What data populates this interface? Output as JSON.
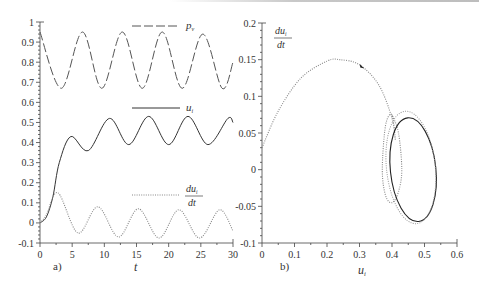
{
  "chart_data": [
    {
      "panel": "a)",
      "type": "line",
      "xlabel": "t",
      "ylabel": "",
      "xlim": [
        0,
        30
      ],
      "ylim": [
        -0.1,
        1
      ],
      "xticks": [
        0,
        5,
        10,
        15,
        20,
        25,
        30
      ],
      "xtick_labels": [
        "0",
        "5",
        "10",
        "15",
        "20",
        "25",
        "30"
      ],
      "yticks": [
        -0.1,
        0,
        0.1,
        0.2,
        0.3,
        0.4,
        0.5,
        0.6,
        0.7,
        0.8,
        0.9,
        1
      ],
      "ytick_labels": [
        "-0.1",
        "0",
        "0.1",
        "0.2",
        "0.3",
        "0.4",
        "0.5",
        "0.6",
        "0.7",
        "0.8",
        "0.9",
        "1"
      ],
      "grid": false,
      "legend_position": "inline, right of each curve",
      "series": [
        {
          "name": "p_v",
          "label_main": "p",
          "label_sub": "v",
          "style": "dashed",
          "color": "#555555",
          "x": [
            0,
            3.3,
            6.6,
            9.6,
            12.8,
            15.9,
            19.0,
            22.1,
            25.3,
            28.3,
            30
          ],
          "y": [
            0.95,
            0.67,
            0.95,
            0.67,
            0.95,
            0.67,
            0.95,
            0.67,
            0.94,
            0.67,
            0.8
          ]
        },
        {
          "name": "u_i",
          "label_main": "u",
          "label_sub": "i",
          "style": "solid",
          "color": "#333333",
          "x": [
            0,
            1,
            2,
            3,
            4.8,
            7.5,
            10.8,
            13.8,
            16.9,
            20.0,
            23.0,
            26.1,
            29.2,
            30
          ],
          "y": [
            0.0,
            0.03,
            0.13,
            0.3,
            0.43,
            0.36,
            0.52,
            0.39,
            0.53,
            0.39,
            0.53,
            0.39,
            0.52,
            0.5
          ]
        },
        {
          "name": "du_i/dt",
          "label_num": "du",
          "label_sub": "i",
          "label_den": "dt",
          "style": "dotted",
          "color": "#888888",
          "x": [
            0,
            1,
            2.8,
            5.9,
            9.0,
            12.2,
            15.3,
            18.5,
            21.6,
            24.8,
            27.9,
            30
          ],
          "y": [
            0.0,
            0.04,
            0.15,
            -0.05,
            0.08,
            -0.07,
            0.07,
            -0.075,
            0.065,
            -0.075,
            0.065,
            -0.04
          ]
        }
      ]
    },
    {
      "panel": "b)",
      "type": "line",
      "xlabel": "u_i",
      "xlabel_main": "u",
      "xlabel_sub": "i",
      "ylabel": "du_i/dt",
      "ylabel_num": "du",
      "ylabel_sub": "i",
      "ylabel_den": "dt",
      "xlim": [
        0,
        0.6
      ],
      "ylim": [
        -0.1,
        0.2
      ],
      "xticks": [
        0,
        0.1,
        0.2,
        0.3,
        0.4,
        0.5,
        0.6
      ],
      "xtick_labels": [
        "0",
        "0.1",
        "0.2",
        "0.3",
        "0.4",
        "0.5",
        "0.6"
      ],
      "yticks": [
        -0.1,
        -0.05,
        0,
        0.05,
        0.1,
        0.15,
        0.2
      ],
      "ytick_labels": [
        "-0.1",
        "-0.05",
        "0",
        "0.05",
        "0.1",
        "0.15",
        "0.2"
      ],
      "grid": false,
      "series": [
        {
          "name": "transient trajectory",
          "style": "dotted",
          "color": "#888888",
          "x": [
            0.0,
            0.05,
            0.12,
            0.2,
            0.24,
            0.3,
            0.36,
            0.4,
            0.41,
            0.4,
            0.38,
            0.37,
            0.38,
            0.4,
            0.42,
            0.43,
            0.42,
            0.4
          ],
          "y": [
            0.03,
            0.08,
            0.125,
            0.148,
            0.15,
            0.143,
            0.115,
            0.07,
            0.04,
            0.075,
            0.06,
            0.0,
            -0.035,
            -0.045,
            -0.03,
            0.0,
            0.05,
            0.075
          ]
        },
        {
          "name": "limit cycle",
          "style": "solid",
          "color": "#222222",
          "center": [
            0.465,
            0.0
          ],
          "radius_u": 0.07,
          "radius_du": 0.071
        },
        {
          "name": "near-cycle trace",
          "style": "dotted",
          "color": "#999999",
          "center": [
            0.458,
            0.003
          ],
          "radius_u": 0.075,
          "radius_du": 0.077
        }
      ],
      "annotations": [
        {
          "type": "arrow",
          "at": [
            0.31,
            0.14
          ],
          "direction": "clockwise"
        }
      ]
    }
  ]
}
